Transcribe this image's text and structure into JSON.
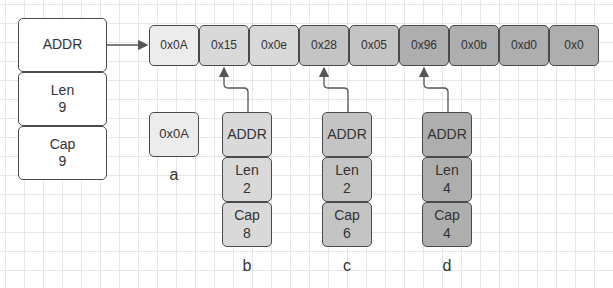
{
  "main_slice": {
    "addr_label": "ADDR",
    "len_label": "Len",
    "len_value": "9",
    "cap_label": "Cap",
    "cap_value": "9"
  },
  "array_cells": [
    {
      "value": "0x0A",
      "color": "#ececec"
    },
    {
      "value": "0x15",
      "color": "#d9d9d9"
    },
    {
      "value": "0x0e",
      "color": "#d9d9d9"
    },
    {
      "value": "0x28",
      "color": "#c4c4c4"
    },
    {
      "value": "0x05",
      "color": "#c4c4c4"
    },
    {
      "value": "0x96",
      "color": "#aeaeae"
    },
    {
      "value": "0x0b",
      "color": "#aeaeae"
    },
    {
      "value": "0xd0",
      "color": "#aeaeae"
    },
    {
      "value": "0x0",
      "color": "#aeaeae"
    }
  ],
  "var_a": {
    "value": "0x0A",
    "name": "a",
    "color": "#ececec"
  },
  "slices": [
    {
      "name": "b",
      "addr_label": "ADDR",
      "len_label": "Len",
      "len_value": "2",
      "cap_label": "Cap",
      "cap_value": "8",
      "color": "#d9d9d9"
    },
    {
      "name": "c",
      "addr_label": "ADDR",
      "len_label": "Len",
      "len_value": "2",
      "cap_label": "Cap",
      "cap_value": "6",
      "color": "#c4c4c4"
    },
    {
      "name": "d",
      "addr_label": "ADDR",
      "len_label": "Len",
      "len_value": "4",
      "cap_label": "Cap",
      "cap_value": "4",
      "color": "#aeaeae"
    }
  ],
  "colors": {
    "border": "#4a4a4a",
    "grid": "#e6e6e6",
    "arrow": "#555555"
  }
}
